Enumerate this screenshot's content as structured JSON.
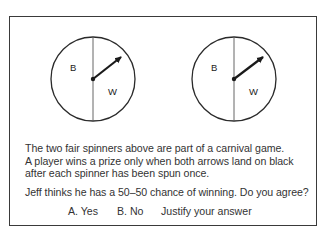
{
  "figure": {
    "spinners": [
      {
        "id": "left",
        "center": [
          93,
          79
        ],
        "radius": 42,
        "sections": [
          "B",
          "W"
        ],
        "arrow_tip": [
          122,
          56
        ]
      },
      {
        "id": "right",
        "center": [
          234,
          79
        ],
        "radius": 42,
        "sections": [
          "B",
          "W"
        ],
        "arrow_tip": [
          264,
          56
        ]
      }
    ],
    "labels": {
      "black": "B",
      "white": "W"
    }
  },
  "problem": {
    "line1": "The two fair spinners above are part of a carnival game.",
    "line2": "A player wins a prize only when both arrows land on black",
    "line3": "after each spinner has been spun once.",
    "question": "Jeff thinks he has a 50–50 chance of winning. Do you agree?"
  },
  "answers": {
    "option_a": "A. Yes",
    "option_b": "B. No",
    "instruction": "Justify your answer"
  },
  "colors": {
    "ink": "#2a2a2a",
    "border": "#3a3a3a",
    "background": "#ffffff"
  }
}
